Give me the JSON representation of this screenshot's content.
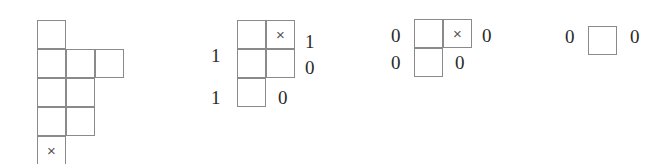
{
  "figure": {
    "background_color": "#ffffff",
    "line_color": "#8a8a8a",
    "label_color": "#2a2a2a",
    "mark_color": "#555555",
    "mark_glyph": "×",
    "cell_size": 29
  },
  "diagrams": [
    {
      "name": "diagram-1",
      "origin": {
        "x": 37,
        "y": 20
      },
      "row_lengths": [
        1,
        3,
        2,
        2,
        1
      ],
      "marked_cell": {
        "row": 4,
        "col": 0
      },
      "cells": [
        {
          "row": 0,
          "col": 0,
          "mark": ""
        },
        {
          "row": 1,
          "col": 0,
          "mark": ""
        },
        {
          "row": 1,
          "col": 1,
          "mark": ""
        },
        {
          "row": 1,
          "col": 2,
          "mark": ""
        },
        {
          "row": 2,
          "col": 0,
          "mark": ""
        },
        {
          "row": 2,
          "col": 1,
          "mark": ""
        },
        {
          "row": 3,
          "col": 0,
          "mark": ""
        },
        {
          "row": 3,
          "col": 1,
          "mark": ""
        },
        {
          "row": 4,
          "col": 0,
          "mark": "×"
        }
      ],
      "labels": []
    },
    {
      "name": "diagram-2",
      "origin": {
        "x": 237,
        "y": 20
      },
      "row_lengths": [
        2,
        2,
        1
      ],
      "marked_cell": {
        "row": 0,
        "col": 1
      },
      "cells": [
        {
          "row": 0,
          "col": 0,
          "mark": ""
        },
        {
          "row": 0,
          "col": 1,
          "mark": "×"
        },
        {
          "row": 1,
          "col": 0,
          "mark": ""
        },
        {
          "row": 1,
          "col": 1,
          "mark": ""
        },
        {
          "row": 2,
          "col": 0,
          "mark": ""
        }
      ],
      "labels": [
        {
          "name": "label-left-row2",
          "text": "1",
          "x": 211,
          "y": 46
        },
        {
          "name": "label-left-row3",
          "text": "1",
          "x": 211,
          "y": 88
        },
        {
          "name": "label-right-row1",
          "text": "1",
          "x": 305,
          "y": 32
        },
        {
          "name": "label-right-row2",
          "text": "0",
          "x": 305,
          "y": 58
        },
        {
          "name": "label-bottom-right",
          "text": "0",
          "x": 278,
          "y": 88
        }
      ]
    },
    {
      "name": "diagram-3",
      "origin": {
        "x": 414,
        "y": 19
      },
      "row_lengths": [
        2,
        1
      ],
      "marked_cell": {
        "row": 0,
        "col": 1
      },
      "cells": [
        {
          "row": 0,
          "col": 0,
          "mark": ""
        },
        {
          "row": 0,
          "col": 1,
          "mark": "×"
        },
        {
          "row": 1,
          "col": 0,
          "mark": ""
        }
      ],
      "labels": [
        {
          "name": "label-left-row1",
          "text": "0",
          "x": 391,
          "y": 26
        },
        {
          "name": "label-left-row2",
          "text": "0",
          "x": 391,
          "y": 53
        },
        {
          "name": "label-right-row1",
          "text": "0",
          "x": 482,
          "y": 26
        },
        {
          "name": "label-bottom-right",
          "text": "0",
          "x": 455,
          "y": 53
        }
      ]
    },
    {
      "name": "diagram-4",
      "origin": {
        "x": 588,
        "y": 26
      },
      "row_lengths": [
        1
      ],
      "marked_cell": null,
      "cells": [
        {
          "row": 0,
          "col": 0,
          "mark": ""
        }
      ],
      "labels": [
        {
          "name": "label-left",
          "text": "0",
          "x": 565,
          "y": 27
        },
        {
          "name": "label-right",
          "text": "0",
          "x": 630,
          "y": 27
        }
      ]
    }
  ]
}
